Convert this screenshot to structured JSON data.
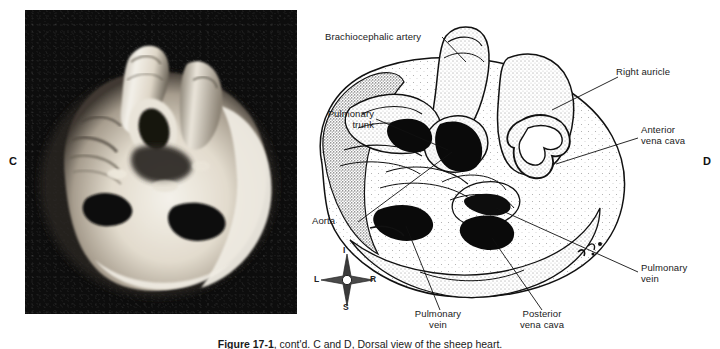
{
  "figure": {
    "panels": [
      {
        "letter": "C",
        "type": "photograph",
        "description": "Black and white photograph of a sheep heart, dorsal view"
      },
      {
        "letter": "D",
        "type": "line-drawing",
        "description": "Stippled line drawing of the same sheep heart with leader-line labels"
      }
    ],
    "caption": {
      "bold_prefix": "Figure 17-1",
      "rest": ", cont'd. C and D, Dorsal view of the sheep heart."
    }
  },
  "labels": {
    "brachiocephalic_artery": "Brachiocephalic artery",
    "right_auricle": "Right auricle",
    "pulmonary_trunk_line1": "Pulmonary",
    "pulmonary_trunk_line2": "trunk",
    "anterior_vena_cava_line1": "Anterior",
    "anterior_vena_cava_line2": "vena cava",
    "aorta": "Aorta",
    "pulmonary_vein_right_line1": "Pulmonary",
    "pulmonary_vein_right_line2": "vein",
    "pulmonary_vein_bottom_line1": "Pulmonary",
    "pulmonary_vein_bottom_line2": "vein",
    "posterior_vena_cava_line1": "Posterior",
    "posterior_vena_cava_line2": "vena cava"
  },
  "compass": {
    "superior": "I",
    "left": "L",
    "right": "R",
    "inferior": "S"
  },
  "colors": {
    "page_background": "#ffffff",
    "ink": "#1a1a1a",
    "photo_background": "#0d0d0d",
    "tissue_highlight": "#f2efe8",
    "tissue_midtone": "#b9b2a4",
    "tissue_shadow": "#4a443b"
  }
}
